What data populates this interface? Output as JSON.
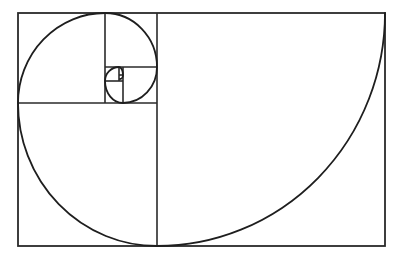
{
  "diagram": {
    "type": "golden-spiral",
    "stroke_color": "#2a2a2a",
    "background": "#ffffff",
    "outer_rectangle": {
      "x": 18,
      "y": 13,
      "width": 367,
      "height": 233
    },
    "squares": [
      {
        "name": "square-1",
        "x": 157,
        "y": 13,
        "size": 228
      },
      {
        "name": "square-2",
        "x": 18,
        "y": 103,
        "size": 139
      },
      {
        "name": "square-3",
        "x": 18,
        "y": 13,
        "size": 87
      },
      {
        "name": "square-4",
        "x": 105,
        "y": 13,
        "size": 52
      },
      {
        "name": "square-5",
        "x": 123,
        "y": 67,
        "size": 34
      },
      {
        "name": "square-6",
        "x": 105,
        "y": 81,
        "size": 22
      },
      {
        "name": "square-7",
        "x": 105,
        "y": 67,
        "size": 14
      },
      {
        "name": "square-8",
        "x": 119,
        "y": 67,
        "size": 4
      }
    ]
  }
}
